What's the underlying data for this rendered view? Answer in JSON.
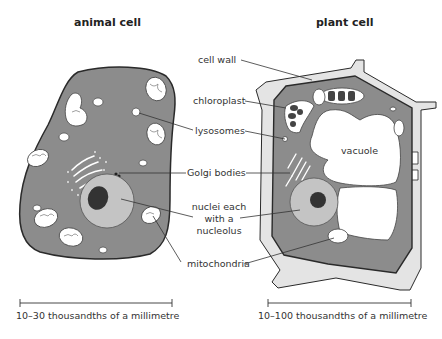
{
  "titles": {
    "animal": "animal cell",
    "plant": "plant cell"
  },
  "labels": {
    "cell_wall": "cell wall",
    "chloroplast": "chloroplast",
    "lysosomes": "lysosomes",
    "golgi": "Golgi bodies",
    "nuclei_line1": "nuclei each",
    "nuclei_line2": "with a",
    "nuclei_line3": "nucleolus",
    "mitochondria": "mitochondria",
    "vacuole": "vacuole"
  },
  "scales": {
    "animal": "10–30 thousandths of a millimetre",
    "plant": "10–100 thousandths of a millimetre"
  },
  "colors": {
    "cytoplasm": "#8c8c8c",
    "nucleus": "#c4c4c4",
    "nucleolus": "#333333",
    "cell_wall": "#e4e4e4",
    "organelle": "#ffffff",
    "outline": "#2a2a2a"
  }
}
